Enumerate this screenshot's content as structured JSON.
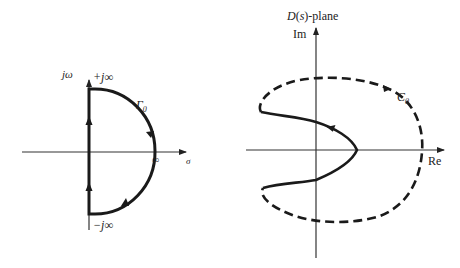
{
  "left_diagram": {
    "vertical_axis_label": "jω",
    "horizontal_axis_label": "σ",
    "top_label": "+j∞",
    "bottom_label": "−j∞",
    "contour_label": "Γ",
    "contour_subscript": "0",
    "infinity_label": "∞"
  },
  "right_diagram": {
    "title": "D(s)-plane",
    "title_D": "D",
    "title_paren_open": "(",
    "title_s": "s",
    "title_rest": ")-plane",
    "vertical_axis_label": "Im",
    "horizontal_axis_label": "Re",
    "contour_label": "C",
    "contour_subscript": "0"
  },
  "colors": {
    "stroke": "#1a1a1a",
    "axis": "#333333",
    "background": "#ffffff"
  }
}
